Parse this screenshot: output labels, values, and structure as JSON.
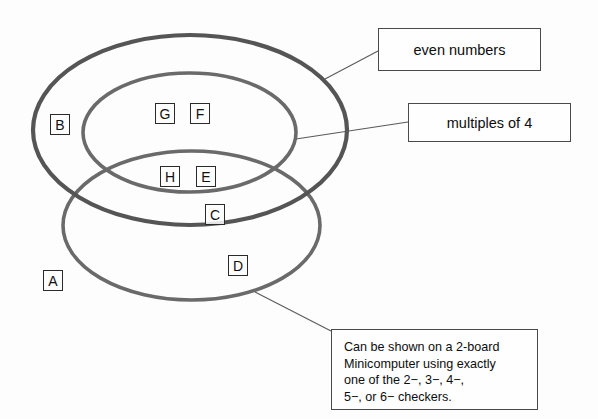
{
  "diagram": {
    "type": "venn-diagram",
    "title": "",
    "background_color": "#fdfdfd",
    "sets": [
      {
        "id": "even-numbers",
        "label": "even numbers",
        "shape": "ellipse",
        "stroke_color": "#555555",
        "stroke_width": 4.2,
        "center": [
          190,
          130
        ],
        "radii": [
          157,
          95
        ]
      },
      {
        "id": "multiples-of-4",
        "label": "multiples of 4",
        "shape": "ellipse",
        "stroke_color": "#6a6a6a",
        "stroke_width": 3.6,
        "center": [
          189.5,
          132.5
        ],
        "radii": [
          106.5,
          59.5
        ]
      },
      {
        "id": "two-board-minicomputer",
        "label": "Can be shown on a 2-board Minicomputer using exactly one of the 2-, 3-, 4-, 5-, or 6- checkers.",
        "shape": "ellipse",
        "stroke_color": "#6a6a6a",
        "stroke_width": 3.6,
        "center": [
          191.5,
          225.5
        ],
        "radii": [
          128.5,
          74.5
        ]
      }
    ],
    "elements": [
      {
        "id": "A",
        "letter": "A",
        "x": 43,
        "y": 270,
        "region": "outside-all"
      },
      {
        "id": "B",
        "letter": "B",
        "x": 50,
        "y": 114,
        "region": "even-numbers-only"
      },
      {
        "id": "C",
        "letter": "C",
        "x": 205,
        "y": 204,
        "region": "even-numbers-and-minicomputer"
      },
      {
        "id": "D",
        "letter": "D",
        "x": 228,
        "y": 255,
        "region": "minicomputer-only"
      },
      {
        "id": "E",
        "letter": "E",
        "x": 196,
        "y": 166,
        "region": "all-three"
      },
      {
        "id": "F",
        "letter": "F",
        "x": 190,
        "y": 103,
        "region": "multiples-of-4-only"
      },
      {
        "id": "G",
        "letter": "G",
        "x": 155,
        "y": 103,
        "region": "multiples-of-4-only"
      },
      {
        "id": "H",
        "letter": "H",
        "x": 160,
        "y": 166,
        "region": "all-three"
      }
    ],
    "callouts": [
      {
        "id": "callout-even-numbers",
        "text": "even numbers",
        "x": 378,
        "y": 28,
        "width": 163,
        "height": 43,
        "style": "center",
        "leader": {
          "x1": 378,
          "y1": 51,
          "x2": 325,
          "y2": 79
        }
      },
      {
        "id": "callout-multiples-of-4",
        "text": "multiples of 4",
        "x": 408,
        "y": 103,
        "width": 163,
        "height": 39,
        "style": "center",
        "leader": {
          "x1": 408,
          "y1": 122,
          "x2": 296,
          "y2": 139
        }
      },
      {
        "id": "callout-minicomputer",
        "text": "Can be shown on a 2-board\nMinicomputer using exactly\none of the 2−, 3−, 4−,\n5−, or 6− checkers.",
        "x": 331,
        "y": 329,
        "width": 207,
        "height": 81,
        "style": "paragraph",
        "leader": {
          "x1": 331,
          "y1": 331,
          "x2": 255,
          "y2": 292
        }
      }
    ]
  }
}
